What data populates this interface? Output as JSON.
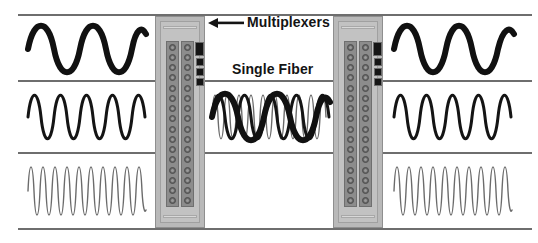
{
  "diagram": {
    "labels": {
      "multiplexers": "Multiplexers",
      "single_fiber": "Single Fiber"
    },
    "icons": {
      "left_arrow": "arrow-left-icon",
      "right_arrow": "arrow-right-icon"
    },
    "colors": {
      "rule": "#6e6e6e",
      "wave_thick": "#111111",
      "wave_medium": "#141414",
      "wave_thin": "#6b6b6b",
      "chassis": "#b9b9b9",
      "chassis_inner": "#c2c2c2",
      "port_strip": "#8c8c8c",
      "port": "#6a6a6a",
      "led": "#151515",
      "background": "#ffffff",
      "text": "#141414"
    },
    "input_channels": [
      {
        "name": "channel-low-frequency",
        "cycles": 3,
        "stroke_width": 6.0,
        "color": "#111111",
        "amplitude": 27
      },
      {
        "name": "channel-mid-frequency",
        "cycles": 6,
        "stroke_width": 3.0,
        "color": "#141414",
        "amplitude": 27
      },
      {
        "name": "channel-high-frequency",
        "cycles": 13,
        "stroke_width": 1.4,
        "color": "#6b6b6b",
        "amplitude": 31
      }
    ],
    "output_channels": [
      {
        "name": "channel-low-frequency",
        "cycles": 3,
        "stroke_width": 6.0,
        "color": "#111111",
        "amplitude": 27
      },
      {
        "name": "channel-mid-frequency",
        "cycles": 6,
        "stroke_width": 3.0,
        "color": "#141414",
        "amplitude": 27
      },
      {
        "name": "channel-high-frequency",
        "cycles": 13,
        "stroke_width": 1.4,
        "color": "#6b6b6b",
        "amplitude": 31
      }
    ],
    "fiber_signal": {
      "name": "multiplexed-signal",
      "description": "Three wavelengths superimposed on one fiber",
      "overlays": [
        {
          "cycles": 3,
          "stroke_width": 6.0,
          "color": "#111111",
          "amplitude": 28
        },
        {
          "cycles": 6,
          "stroke_width": 3.0,
          "color": "#141414",
          "amplitude": 28
        },
        {
          "cycles": 13,
          "stroke_width": 1.4,
          "color": "#6b6b6b",
          "amplitude": 30
        }
      ]
    },
    "multiplexer_unit": {
      "port_columns": 2,
      "ports_per_column": 16,
      "leds": [
        {
          "size": "big"
        },
        {
          "size": "small"
        },
        {
          "size": "small"
        },
        {
          "size": "small"
        }
      ]
    },
    "rules": [
      {
        "name": "rule-top",
        "x": 18,
        "y": 14,
        "width": 418
      },
      {
        "name": "rule-channel-1-2",
        "x": 18,
        "y": 80,
        "width": 418
      },
      {
        "name": "rule-channel-2-3",
        "x": 18,
        "y": 152,
        "width": 418
      },
      {
        "name": "rule-bottom",
        "x": 18,
        "y": 228,
        "width": 418
      },
      {
        "name": "rule-top-right",
        "x": 372,
        "y": 14,
        "width": 160
      },
      {
        "name": "rule-channel-1-2-right",
        "x": 372,
        "y": 80,
        "width": 160
      },
      {
        "name": "rule-channel-2-3-right",
        "x": 372,
        "y": 152,
        "width": 160
      },
      {
        "name": "rule-bottom-right",
        "x": 372,
        "y": 228,
        "width": 160
      }
    ]
  }
}
